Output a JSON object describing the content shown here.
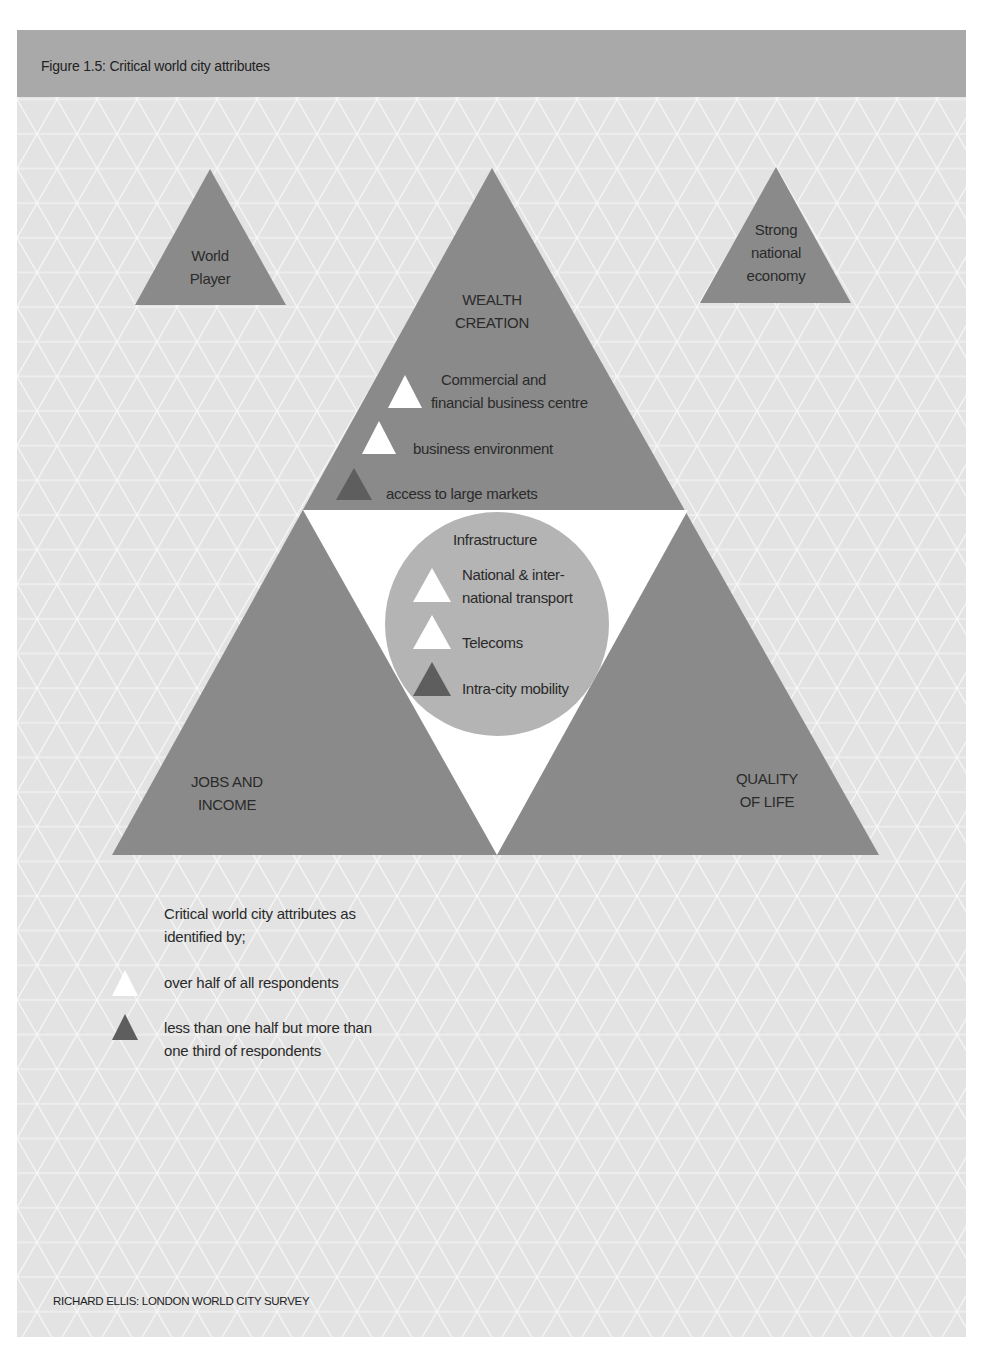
{
  "figure": {
    "title": "Figure 1.5: Critical world city attributes",
    "source": "RICHARD ELLIS: LONDON WORLD CITY SURVEY"
  },
  "colors": {
    "page_background": "#e3e3e3",
    "header_band": "#a9a9a9",
    "big_triangle": "#8a8a8a",
    "circle": "#b4b4b4",
    "inner_triangle": "#ffffff",
    "marker_over_half": "#ffffff",
    "marker_third_to_half": "#5e5e5e"
  },
  "side_triangles": [
    {
      "id": "world-player",
      "lines": [
        "World",
        "Player"
      ]
    },
    {
      "id": "strong-national-economy",
      "lines": [
        "Strong",
        "national",
        "economy"
      ]
    }
  ],
  "main_triangles": {
    "top": {
      "title_lines": [
        "WEALTH",
        "CREATION"
      ],
      "items": [
        {
          "lines": [
            "Commercial and",
            "financial business centre"
          ],
          "marker": "over_half"
        },
        {
          "lines": [
            "business environment"
          ],
          "marker": "over_half"
        },
        {
          "lines": [
            "access to large markets"
          ],
          "marker": "third_to_half"
        }
      ]
    },
    "bottom_left": {
      "title_lines": [
        "JOBS AND",
        "INCOME"
      ]
    },
    "bottom_right": {
      "title_lines": [
        "QUALITY",
        "OF LIFE"
      ]
    }
  },
  "infrastructure": {
    "title": "Infrastructure",
    "items": [
      {
        "lines": [
          "National & inter-",
          "national transport"
        ],
        "marker": "over_half"
      },
      {
        "lines": [
          "Telecoms"
        ],
        "marker": "over_half"
      },
      {
        "lines": [
          "Intra-city mobility"
        ],
        "marker": "third_to_half"
      }
    ]
  },
  "legend": {
    "intro_lines": [
      "Critical world city attributes as",
      "identified by;"
    ],
    "entries": [
      {
        "marker": "over_half",
        "lines": [
          "over half of all respondents"
        ]
      },
      {
        "marker": "third_to_half",
        "lines": [
          "less than one half but more than",
          "one third of respondents"
        ]
      }
    ]
  }
}
